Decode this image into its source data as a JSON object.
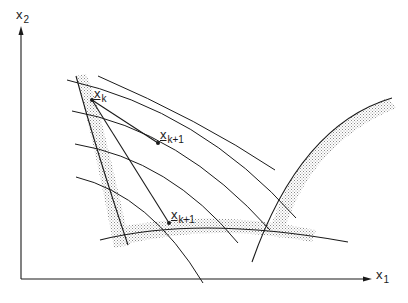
{
  "diagram": {
    "type": "constrained-optimization-iteration",
    "axes": {
      "x": {
        "label": "x",
        "subscript": "1"
      },
      "y": {
        "label": "x",
        "subscript": "2"
      }
    },
    "points": [
      {
        "id": "xk",
        "label": "x",
        "subscript": "k",
        "underlined": true
      },
      {
        "id": "xk1_upper",
        "label": "x",
        "subscript": "k+1",
        "underlined": true
      },
      {
        "id": "xk1_lower",
        "label": "x",
        "subscript": "k+1",
        "underlined": true
      }
    ],
    "elements": {
      "objective_contours": 5,
      "constraint_boundaries": 3,
      "infeasible_side_shading": "stippled",
      "search_directions": 2
    },
    "colors": {
      "line": "#1a1a1a",
      "stipple": "#9a9a9a",
      "background": "#ffffff"
    }
  }
}
